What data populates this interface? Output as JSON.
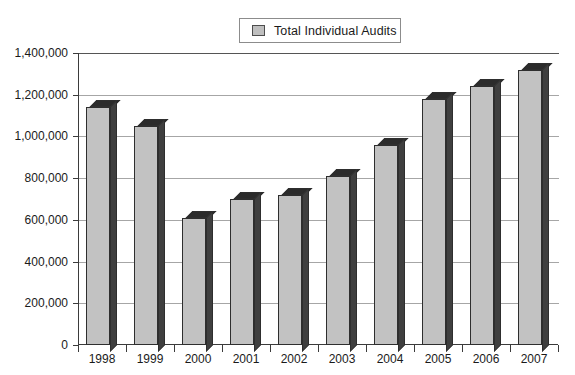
{
  "chart_data": {
    "type": "bar",
    "title": "",
    "subtitle": "",
    "xlabel": "",
    "ylabel": "",
    "categories": [
      "1998",
      "1999",
      "2000",
      "2001",
      "2002",
      "2003",
      "2004",
      "2005",
      "2006",
      "2007"
    ],
    "series": [
      {
        "name": "Total Individual Audits",
        "values": [
          1140000,
          1050000,
          610000,
          700000,
          720000,
          810000,
          960000,
          1180000,
          1240000,
          1320000
        ]
      }
    ],
    "ylim": [
      0,
      1400000
    ],
    "ytick_step": 200000,
    "ytick_labels": [
      "1,400,000",
      "1,200,000",
      "1,000,000",
      "800,000",
      "600,000",
      "400,000",
      "200,000",
      "0"
    ],
    "ytick_values": [
      1400000,
      1200000,
      1000000,
      800000,
      600000,
      400000,
      200000,
      0
    ],
    "grid": true,
    "grid_axis": "y",
    "legend": {
      "position": "top-center",
      "entries": [
        {
          "label": "Total Individual Audits",
          "color": "#c2c2c2"
        }
      ]
    },
    "style": {
      "bar_face_color": "#c2c2c2",
      "bar_side_color": "#3f3f3f",
      "bar_top_color": "#2b2b2b",
      "bar_outline_color": "#2e2e2e",
      "grid_color": "#a6a6a6",
      "axis_color": "#3b3b3b",
      "background": "#ffffff",
      "three_d": true
    }
  }
}
